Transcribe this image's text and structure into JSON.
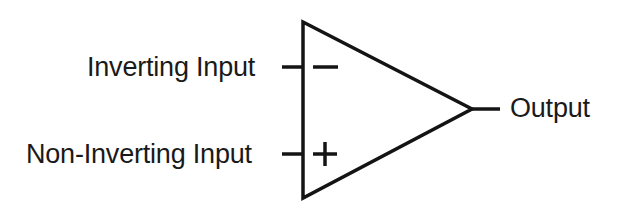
{
  "diagram": {
    "type": "op-amp-symbol",
    "labels": {
      "inverting_input": "Inverting Input",
      "non_inverting_input": "Non-Inverting Input",
      "output": "Output"
    },
    "symbols": {
      "inverting_sign": "−",
      "non_inverting_sign": "+"
    },
    "colors": {
      "stroke": "#141414",
      "text": "#1a1a1a",
      "background": "#ffffff"
    }
  }
}
